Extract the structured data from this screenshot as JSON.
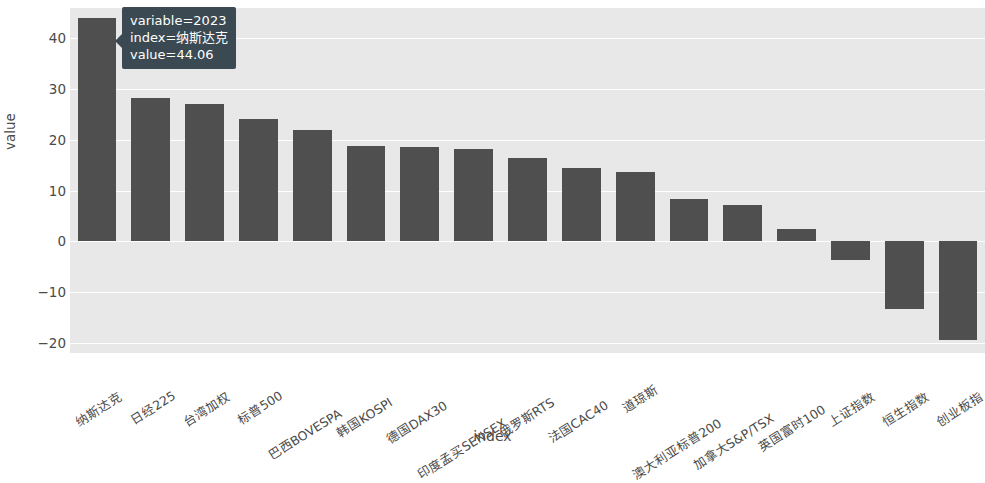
{
  "chart_data": {
    "type": "bar",
    "title": "",
    "xlabel": "index",
    "ylabel": "value",
    "grid": true,
    "legend": "none",
    "ylim": [
      -22,
      46
    ],
    "yticks": [
      40,
      30,
      20,
      10,
      0,
      -10,
      -20
    ],
    "ytick_labels": [
      "40",
      "30",
      "20",
      "10",
      "0",
      "−10",
      "−20"
    ],
    "categories": [
      "纳斯达克",
      "日经225",
      "台湾加权",
      "标普500",
      "巴西BOVESPA",
      "韩国KOSPI",
      "德国DAX30",
      "印度孟买SENSEX",
      "俄罗斯RTS",
      "法国CAC40",
      "道琼斯",
      "澳大利亚标普200",
      "加拿大S&P/TSX",
      "英国富时100",
      "上证指数",
      "恒生指数",
      "创业板指"
    ],
    "values": [
      44.06,
      28.3,
      27.1,
      24.1,
      22.0,
      18.8,
      18.6,
      18.2,
      16.4,
      14.5,
      13.6,
      8.3,
      7.2,
      2.4,
      -3.7,
      -13.3,
      -19.5
    ],
    "series_name": "2023",
    "bar_color": "#4F4F4F",
    "plot_bgcolor": "#E8E8E8",
    "gridline_color": "#FFFFFF"
  },
  "tooltip": {
    "variable_line": "variable=2023",
    "index_line": "index=纳斯达克",
    "value_line": "value=44.06"
  }
}
